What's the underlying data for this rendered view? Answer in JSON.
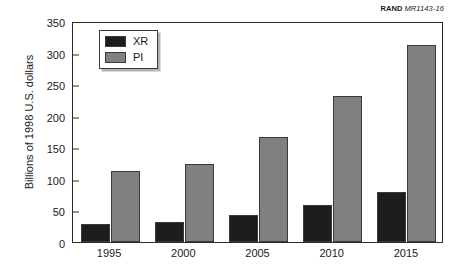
{
  "credit": {
    "organization": "RAND",
    "document_id": "MR1143-16"
  },
  "chart_data": {
    "type": "bar",
    "title": "",
    "xlabel": "",
    "ylabel": "Billions of 1998 U.S. dollars",
    "categories": [
      "1995",
      "2000",
      "2005",
      "2010",
      "2015"
    ],
    "series": [
      {
        "name": "XR",
        "color": "#1d1d1d",
        "values": [
          28,
          31,
          43,
          59,
          79
        ]
      },
      {
        "name": "PI",
        "color": "#808080",
        "values": [
          112,
          123,
          167,
          232,
          312
        ]
      }
    ],
    "ylim": [
      0,
      350
    ],
    "ytick_step": 50,
    "yticks": [
      0,
      50,
      100,
      150,
      200,
      250,
      300,
      350
    ],
    "grid": false,
    "legend_position": "upper left"
  }
}
